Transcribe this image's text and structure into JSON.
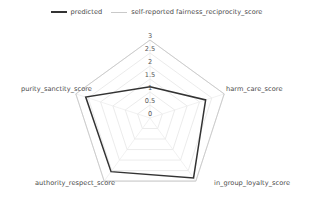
{
  "chart_data": {
    "type": "radar",
    "title": "",
    "categories": [
      "fairness_reciprocity_score",
      "harm_care_score",
      "in_group_loyalty_score",
      "authority_respect_score",
      "purity_sanctity_score"
    ],
    "series": [
      {
        "name": "predicted",
        "color": "#333333",
        "values": [
          1.2,
          2.25,
          2.85,
          2.55,
          2.6
        ]
      },
      {
        "name": "self-reported fairness_reciprocity_score",
        "color": "#c9c9c9",
        "values": [
          3.0,
          3.0,
          3.0,
          3.0,
          3.0
        ]
      }
    ],
    "rlim": [
      0,
      3
    ],
    "rticks": [
      "0",
      "0.5",
      "1",
      "1.5",
      "2",
      "2.5",
      "3"
    ],
    "rtick_values": [
      0,
      0.5,
      1,
      1.5,
      2,
      2.5,
      3
    ],
    "grid": true,
    "grid_color": "#e3e3e3",
    "legend_position": "top-center",
    "xlabel": "",
    "ylabel": ""
  },
  "legend": {
    "entries": [
      {
        "label": "predicted"
      },
      {
        "label": "self-reported fairness_reciprocity_score"
      }
    ]
  },
  "axis_labels": {
    "top": "",
    "right": "harm_care_score",
    "bottom_right": "in_group_loyalty_score",
    "bottom_left": "authority_respect_score",
    "left": "purity_sanctity_score"
  },
  "tick_labels": {
    "t3": "3",
    "t25": "2.5",
    "t2": "2",
    "t15": "1.5",
    "t1": "1",
    "t05": "0.5",
    "t0": "0"
  }
}
